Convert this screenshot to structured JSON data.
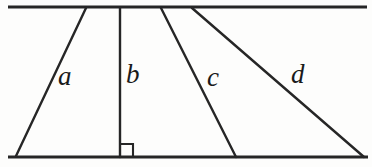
{
  "figure": {
    "background_color": "#fdfdfc",
    "stroke_color": "#262626",
    "labels": {
      "a": "a",
      "b": "b",
      "c": "c",
      "d": "d"
    },
    "right_angle_marker": {
      "present": true,
      "at_segment": "b",
      "size": 13
    }
  },
  "chart_data": {
    "type": "diagram",
    "xlabel": "",
    "ylabel": "",
    "xlim": [
      0,
      372
    ],
    "ylim": [
      0,
      167
    ],
    "grid": false,
    "legend": "none",
    "series": [
      {
        "name": "top-horizontal-line",
        "label": "",
        "x": [
          8,
          367
        ],
        "y": [
          7,
          7
        ]
      },
      {
        "name": "bottom-horizontal-line",
        "label": "",
        "x": [
          8,
          368
        ],
        "y": [
          157,
          157
        ]
      },
      {
        "name": "segment-a",
        "label": "a",
        "x": [
          86,
          16
        ],
        "y": [
          8,
          156
        ]
      },
      {
        "name": "segment-b",
        "label": "b",
        "x": [
          120,
          120
        ],
        "y": [
          8,
          157
        ]
      },
      {
        "name": "segment-c",
        "label": "c",
        "x": [
          161,
          236
        ],
        "y": [
          8,
          157
        ]
      },
      {
        "name": "segment-d",
        "label": "d",
        "x": [
          192,
          364
        ],
        "y": [
          8,
          157
        ]
      }
    ],
    "annotations": [
      {
        "text": "a",
        "x": 70,
        "y": 82
      },
      {
        "text": "b",
        "x": 135,
        "y": 80
      },
      {
        "text": "c",
        "x": 216,
        "y": 83
      },
      {
        "text": "d",
        "x": 302,
        "y": 80
      }
    ]
  }
}
